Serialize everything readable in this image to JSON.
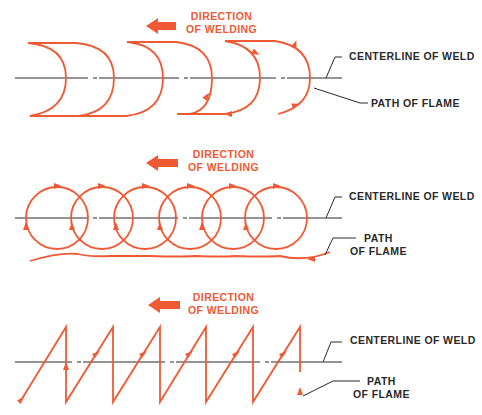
{
  "colors": {
    "flame": "#ef5a35",
    "line": "#2a2a2a",
    "background": "#ffffff"
  },
  "panels": [
    {
      "id": "crescent",
      "direction_label_line1": "DIRECTION",
      "direction_label_line2": "OF WELDING",
      "centerline_label": "CENTERLINE OF WELD",
      "path_label_line1": "PATH OF FLAME",
      "path_label_line2": ""
    },
    {
      "id": "circular",
      "direction_label_line1": "DIRECTION",
      "direction_label_line2": "OF WELDING",
      "centerline_label": "CENTERLINE OF WELD",
      "path_label_line1": "PATH",
      "path_label_line2": "OF FLAME"
    },
    {
      "id": "zigzag",
      "direction_label_line1": "DIRECTION",
      "direction_label_line2": "OF WELDING",
      "centerline_label": "CENTERLINE OF WELD",
      "path_label_line1": "PATH",
      "path_label_line2": "OF FLAME"
    }
  ]
}
